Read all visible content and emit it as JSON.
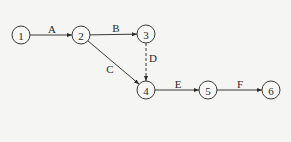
{
  "diagram": {
    "type": "activity-on-arrow network",
    "nodes": [
      {
        "id": "1",
        "label": "1",
        "x": 21,
        "y": 35
      },
      {
        "id": "2",
        "label": "2",
        "x": 81,
        "y": 35
      },
      {
        "id": "3",
        "label": "3",
        "x": 146,
        "y": 34
      },
      {
        "id": "4",
        "label": "4",
        "x": 146,
        "y": 90
      },
      {
        "id": "5",
        "label": "5",
        "x": 208,
        "y": 90
      },
      {
        "id": "6",
        "label": "6",
        "x": 271,
        "y": 90
      }
    ],
    "edges": [
      {
        "from": "1",
        "to": "2",
        "label": "A",
        "style": "solid",
        "lx": 52,
        "ly": 29
      },
      {
        "from": "2",
        "to": "3",
        "label": "B",
        "style": "solid",
        "lx": 116,
        "ly": 28
      },
      {
        "from": "2",
        "to": "4",
        "label": "C",
        "style": "solid",
        "lx": 110,
        "ly": 69
      },
      {
        "from": "3",
        "to": "4",
        "label": "D",
        "style": "dashed",
        "lx": 153,
        "ly": 58
      },
      {
        "from": "4",
        "to": "5",
        "label": "E",
        "style": "solid",
        "lx": 178,
        "ly": 84
      },
      {
        "from": "5",
        "to": "6",
        "label": "F",
        "style": "solid",
        "lx": 240,
        "ly": 84
      }
    ]
  }
}
